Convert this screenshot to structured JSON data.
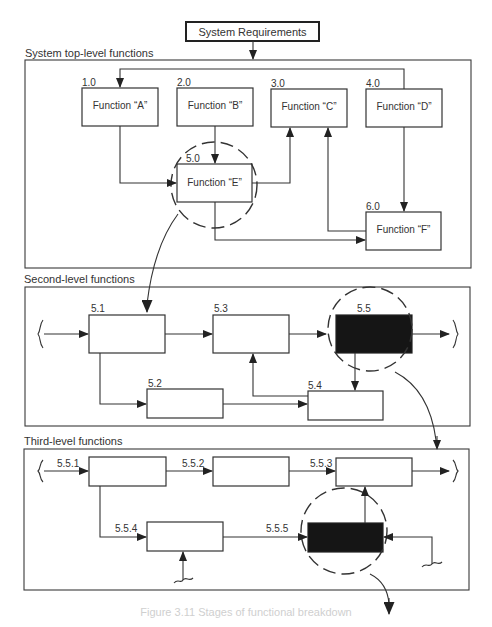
{
  "header": {
    "root_box_label": "System Requirements"
  },
  "sections": {
    "top": {
      "label": "System top-level functions",
      "functions": [
        {
          "id": "1.0",
          "label": "Function “A”"
        },
        {
          "id": "2.0",
          "label": "Function “B”"
        },
        {
          "id": "3.0",
          "label": "Function “C”"
        },
        {
          "id": "4.0",
          "label": "Function “D”"
        },
        {
          "id": "5.0",
          "label": "Function “E”",
          "highlighted": true
        },
        {
          "id": "6.0",
          "label": "Function “F”"
        }
      ]
    },
    "second": {
      "label": "Second-level functions",
      "functions": [
        {
          "id": "5.1"
        },
        {
          "id": "5.2"
        },
        {
          "id": "5.3"
        },
        {
          "id": "5.4"
        },
        {
          "id": "5.5",
          "highlighted": true,
          "filled": true
        }
      ]
    },
    "third": {
      "label": "Third-level functions",
      "functions": [
        {
          "id": "5.5.1"
        },
        {
          "id": "5.5.2"
        },
        {
          "id": "5.5.3"
        },
        {
          "id": "5.5.4"
        },
        {
          "id": "5.5.5",
          "highlighted": true,
          "filled": true
        }
      ]
    }
  },
  "caption": "Figure 3.11   Stages of functional breakdown",
  "colors": {
    "line": "#333333",
    "filled_box": "#151515",
    "background": "#ffffff"
  }
}
